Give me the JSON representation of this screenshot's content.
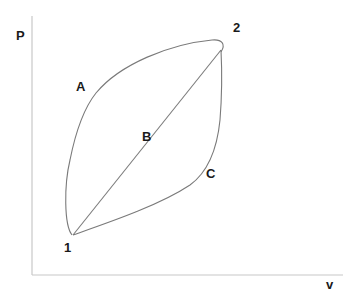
{
  "diagram": {
    "type": "P-v process diagram",
    "axes": {
      "y_label": "P",
      "x_label": "v"
    },
    "states": [
      {
        "id": "1",
        "label": "1"
      },
      {
        "id": "2",
        "label": "2"
      }
    ],
    "paths": [
      {
        "id": "A",
        "label": "A",
        "from": "1",
        "to": "2",
        "shape": "concave up-then-right (upper curve)"
      },
      {
        "id": "B",
        "label": "B",
        "from": "1",
        "to": "2",
        "shape": "straight line"
      },
      {
        "id": "C",
        "label": "C",
        "from": "1",
        "to": "2",
        "shape": "lower curve (right-then-up)"
      }
    ],
    "colors": {
      "axis": "#c8c8c8",
      "curve": "#7a7a7a",
      "text": "#1a1a1a"
    }
  }
}
